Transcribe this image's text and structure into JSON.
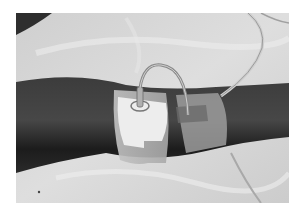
{
  "image": {
    "description": "Grayscale photograph of a forearm with an intravenous catheter and tubing secured by adhesive tape, resting on a white plastic sheet",
    "colors": {
      "background": "#ffffff",
      "sheet": "#d6d6d6",
      "sheet_highlight": "#eeeeee",
      "skin_dark": "#2a2a2a",
      "skin_mid": "#4a4a4a",
      "tape": "#b8b8b8",
      "dressing": "#ececec",
      "tubing": "#9a9a9a"
    }
  }
}
